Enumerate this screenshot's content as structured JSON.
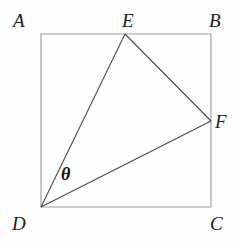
{
  "figure": {
    "type": "geometry-diagram",
    "canvas": {
      "width": 240,
      "height": 245,
      "background": "#fefefe"
    },
    "style": {
      "square_stroke": "#9a9a9a",
      "triangle_stroke": "#4a4a4a",
      "square_stroke_width": 1.1,
      "triangle_stroke_width": 1.1,
      "label_color": "#1b1b1b"
    },
    "points": [
      {
        "id": "A",
        "label": "A",
        "x": 41,
        "y": 34,
        "label_x": 13,
        "label_y": 11
      },
      {
        "id": "B",
        "label": "B",
        "x": 211,
        "y": 34,
        "label_x": 209,
        "label_y": 11
      },
      {
        "id": "C",
        "label": "C",
        "x": 211,
        "y": 207,
        "label_x": 210,
        "label_y": 214
      },
      {
        "id": "D",
        "label": "D",
        "x": 41,
        "y": 207,
        "label_x": 12,
        "label_y": 214
      },
      {
        "id": "E",
        "label": "E",
        "x": 125,
        "y": 34,
        "label_x": 122,
        "label_y": 11
      },
      {
        "id": "F",
        "label": "F",
        "x": 211,
        "y": 121,
        "label_x": 215,
        "label_y": 112
      }
    ],
    "square": {
      "id": "ABCD",
      "vertices": "A,B,C,D",
      "path": "41,34 211,34 211,207 41,207"
    },
    "segments": [
      {
        "id": "DE",
        "from": "D",
        "to": "E",
        "x1": 41,
        "y1": 207,
        "x2": 125,
        "y2": 34
      },
      {
        "id": "EF",
        "from": "E",
        "to": "F",
        "x1": 125,
        "y1": 34,
        "x2": 211,
        "y2": 121
      },
      {
        "id": "DF",
        "from": "D",
        "to": "F",
        "x1": 41,
        "y1": 207,
        "x2": 211,
        "y2": 121
      }
    ],
    "angle": {
      "id": "theta-at-D",
      "label": "θ",
      "vertex": "D",
      "between": "DE,DF",
      "label_x": 61,
      "label_y": 165
    }
  }
}
